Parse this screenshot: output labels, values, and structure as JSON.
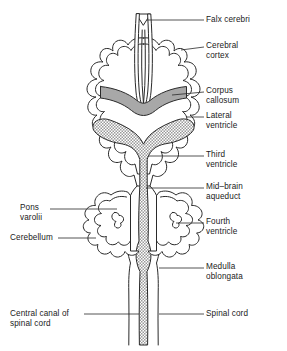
{
  "figure": {
    "background_color": "#ffffff",
    "line_color": "#2a2a2a",
    "corpus_callosum_fill": "#a6a6a6",
    "ventricle_fill": "#d8d8d8"
  },
  "labels": {
    "falx_cerebri": "Falx cerebri",
    "cerebral_cortex": "Cerebral\ncortex",
    "corpus_callosum": "Corpus\ncallosum",
    "lateral_ventricle": "Lateral\nventricle",
    "third_ventricle": "Third\nventricle",
    "midbrain_aqueduct": "Mid–brain\naqueduct",
    "fourth_ventricle": "Fourth\nventricle",
    "medulla_oblongata": "Medulla\noblongata",
    "spinal_cord": "Spinal cord",
    "pons_varolii": "Pons\nvarolii",
    "cerebellum": "Cerebellum",
    "central_canal": "Central canal of\nspinal cord"
  },
  "structures": {
    "falx_cerebri": "falx-cerebri-wedge",
    "cerebral_cortex": "cerebral-cortex-gyri-outline",
    "corpus_callosum": "corpus-callosum-band",
    "lateral_ventricle": "lateral-ventricle-wings",
    "third_ventricle": "third-ventricle-channel",
    "midbrain_aqueduct": "midbrain-aqueduct-channel",
    "fourth_ventricle": "fourth-ventricle-cavity",
    "cerebellum": "cerebellum-folia-left-right",
    "pons_varolii": "pons-varolii-region",
    "medulla_oblongata": "medulla-oblongata-column",
    "spinal_cord": "spinal-cord-column",
    "central_canal": "central-canal-stipple"
  }
}
